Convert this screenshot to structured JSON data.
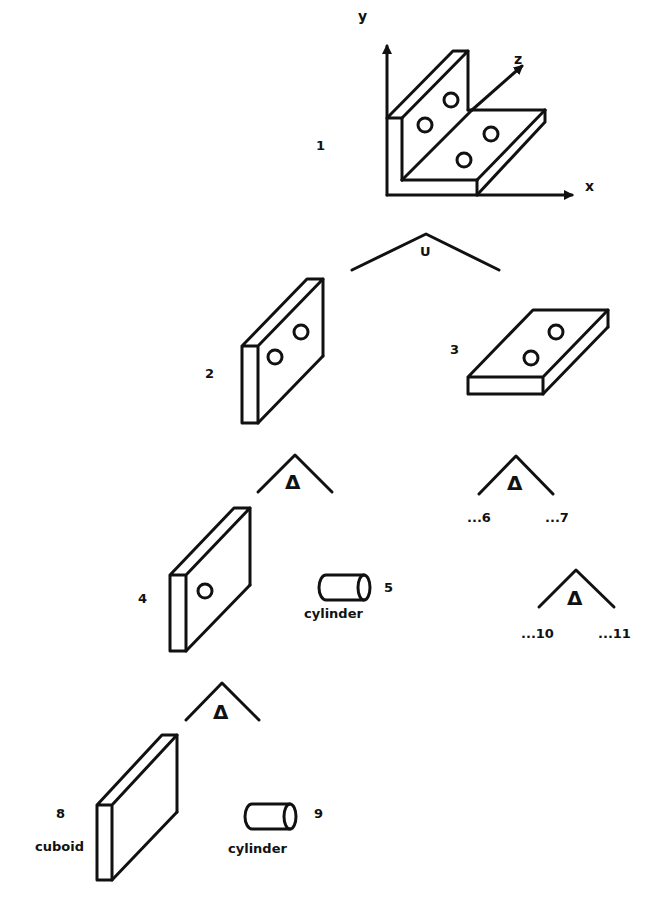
{
  "diagram": {
    "type": "CSG tree (constructive solid geometry decomposition)",
    "axes": {
      "x": "x",
      "y": "y",
      "z": "z"
    },
    "nodes": [
      {
        "id": "1",
        "label": "1",
        "description": "L-bracket with four holes"
      },
      {
        "id": "2",
        "label": "2",
        "description": "vertical plate with two holes"
      },
      {
        "id": "3",
        "label": "3",
        "description": "horizontal plate with two holes"
      },
      {
        "id": "4",
        "label": "4",
        "description": "vertical plate with one hole"
      },
      {
        "id": "5",
        "label": "5",
        "primitive": "cylinder"
      },
      {
        "id": "6",
        "label": "...6"
      },
      {
        "id": "7",
        "label": "...7"
      },
      {
        "id": "8",
        "label": "8",
        "primitive": "cuboid"
      },
      {
        "id": "9",
        "label": "9",
        "primitive": "cylinder"
      },
      {
        "id": "10",
        "label": "...10"
      },
      {
        "id": "11",
        "label": "...11"
      }
    ],
    "operators": [
      {
        "symbol": "U",
        "name": "union",
        "children": [
          "2",
          "3"
        ]
      },
      {
        "symbol": "Δ",
        "name": "difference",
        "children": [
          "4",
          "5"
        ]
      },
      {
        "symbol": "Δ",
        "name": "difference",
        "children": [
          "6",
          "7"
        ]
      },
      {
        "symbol": "Δ",
        "name": "difference",
        "children": [
          "8",
          "9"
        ]
      },
      {
        "symbol": "Δ",
        "name": "difference",
        "children": [
          "10",
          "11"
        ]
      }
    ]
  },
  "labels": {
    "n1": "1",
    "n2": "2",
    "n3": "3",
    "n4": "4",
    "n5": "5",
    "n6": "...6",
    "n7": "...7",
    "n8": "8",
    "n9": "9",
    "n10": "...10",
    "n11": "...11",
    "cyl5": "cylinder",
    "cyl9": "cylinder",
    "cuboid8": "cuboid",
    "ax_x": "x",
    "ax_y": "y",
    "ax_z": "z",
    "union": "U",
    "diff": "Δ"
  }
}
